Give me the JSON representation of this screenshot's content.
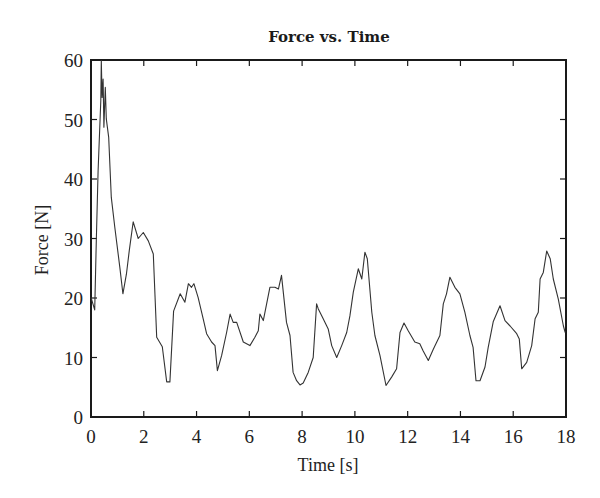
{
  "chart_data": {
    "type": "line",
    "title": "Force vs. Time",
    "xlabel": "Time [s]",
    "ylabel": "Force [N]",
    "xlim": [
      0,
      18
    ],
    "ylim": [
      0,
      60
    ],
    "xticks": [
      0,
      2,
      4,
      6,
      8,
      10,
      12,
      14,
      16,
      18
    ],
    "yticks": [
      0,
      10,
      20,
      30,
      40,
      50,
      60
    ],
    "grid": false,
    "legend": null,
    "line_color": "#333333",
    "series": [
      {
        "name": "Force",
        "x": [
          0.0,
          0.14,
          0.2,
          0.27,
          0.37,
          0.39,
          0.42,
          0.46,
          0.49,
          0.54,
          0.58,
          0.67,
          0.77,
          0.9,
          1.09,
          1.21,
          1.34,
          1.45,
          1.6,
          1.79,
          1.98,
          2.17,
          2.36,
          2.49,
          2.7,
          2.87,
          2.99,
          3.13,
          3.38,
          3.56,
          3.69,
          3.81,
          3.9,
          4.06,
          4.25,
          4.38,
          4.57,
          4.7,
          4.79,
          4.95,
          5.14,
          5.27,
          5.39,
          5.52,
          5.77,
          6.02,
          6.21,
          6.34,
          6.4,
          6.53,
          6.78,
          6.97,
          7.1,
          7.22,
          7.41,
          7.54,
          7.66,
          7.79,
          7.92,
          8.04,
          8.23,
          8.42,
          8.55,
          8.61,
          8.8,
          8.99,
          9.12,
          9.31,
          9.5,
          9.69,
          9.81,
          9.94,
          10.13,
          10.26,
          10.38,
          10.47,
          10.64,
          10.76,
          10.95,
          11.18,
          11.39,
          11.58,
          11.71,
          11.86,
          12.02,
          12.27,
          12.46,
          12.59,
          12.78,
          12.97,
          13.22,
          13.35,
          13.47,
          13.6,
          13.79,
          13.98,
          14.17,
          14.36,
          14.48,
          14.59,
          14.74,
          14.93,
          15.05,
          15.24,
          15.5,
          15.69,
          15.88,
          16.13,
          16.23,
          16.32,
          16.51,
          16.7,
          16.83,
          16.95,
          17.02,
          17.14,
          17.27,
          17.4,
          17.52,
          17.71,
          17.9,
          17.97
        ],
        "y": [
          20.1,
          18.0,
          29.6,
          41.4,
          53.2,
          59.9,
          53.7,
          56.8,
          48.7,
          55.4,
          50.1,
          47.0,
          36.9,
          31.9,
          25.2,
          20.7,
          24.0,
          28.0,
          32.8,
          30.0,
          31.0,
          29.6,
          27.4,
          13.4,
          11.8,
          5.9,
          5.9,
          17.8,
          20.7,
          19.3,
          22.4,
          21.8,
          22.4,
          20.1,
          16.5,
          14.0,
          12.6,
          12.0,
          7.8,
          10.3,
          14.2,
          17.3,
          15.9,
          15.9,
          12.6,
          12.0,
          13.4,
          14.5,
          17.3,
          16.2,
          21.8,
          21.8,
          21.5,
          23.8,
          15.9,
          13.7,
          7.5,
          6.1,
          5.4,
          5.7,
          7.5,
          10.0,
          19.0,
          18.2,
          16.5,
          14.8,
          12.0,
          10.0,
          12.0,
          14.2,
          17.0,
          21.0,
          24.9,
          23.2,
          27.7,
          26.6,
          17.6,
          13.7,
          10.3,
          5.3,
          6.7,
          8.1,
          14.2,
          15.8,
          14.5,
          12.6,
          12.3,
          11.1,
          9.5,
          11.4,
          13.7,
          19.0,
          20.7,
          23.5,
          21.8,
          20.7,
          17.6,
          13.7,
          11.7,
          6.1,
          6.1,
          8.4,
          11.7,
          16.0,
          18.7,
          16.2,
          15.3,
          14.0,
          13.1,
          8.1,
          9.2,
          12.0,
          16.5,
          17.6,
          23.2,
          24.3,
          27.9,
          26.6,
          23.2,
          19.8,
          15.3,
          14.2
        ]
      }
    ]
  }
}
